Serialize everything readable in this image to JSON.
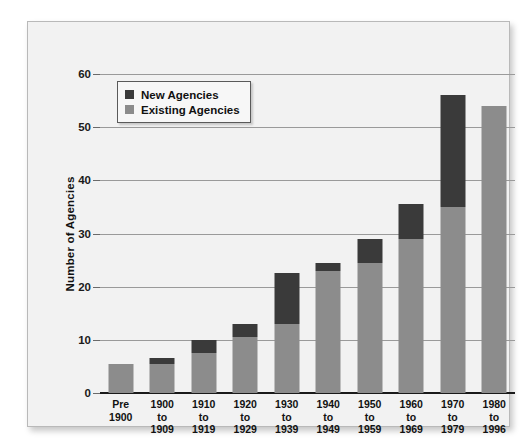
{
  "chart_data": {
    "type": "bar",
    "subtype": "stacked-bar",
    "title": "",
    "xlabel": "",
    "ylabel": "Number of Agencies",
    "ylim": [
      0,
      60
    ],
    "yticks": [
      0,
      10,
      20,
      30,
      40,
      50,
      60
    ],
    "grid": true,
    "legend_position": "top-left",
    "categories": [
      "Pre 1900",
      "1900 to 1909",
      "1910 to 1919",
      "1920 to 1929",
      "1930 to 1939",
      "1940 to 1949",
      "1950 to 1959",
      "1960 to 1969",
      "1970 to 1979",
      "1980 to 1996"
    ],
    "category_lines": [
      [
        "Pre",
        "1900"
      ],
      [
        "1900",
        "to",
        "1909"
      ],
      [
        "1910",
        "to",
        "1919"
      ],
      [
        "1920",
        "to",
        "1929"
      ],
      [
        "1930",
        "to",
        "1939"
      ],
      [
        "1940",
        "to",
        "1949"
      ],
      [
        "1950",
        "to",
        "1959"
      ],
      [
        "1960",
        "to",
        "1969"
      ],
      [
        "1970",
        "to",
        "1979"
      ],
      [
        "1980",
        "to",
        "1996"
      ]
    ],
    "series": [
      {
        "name": "Existing Agencies",
        "color": "#8c8c8c",
        "values": [
          5.5,
          5.5,
          7.5,
          10.5,
          13,
          23,
          24.5,
          29,
          35,
          54
        ]
      },
      {
        "name": "New Agencies",
        "color": "#3a3a3a",
        "values": [
          0,
          1,
          2.5,
          2.5,
          9.5,
          1.5,
          4.5,
          6.5,
          21,
          0
        ]
      }
    ],
    "totals": [
      5.5,
      6.5,
      10,
      13,
      22.5,
      24.5,
      29,
      35.5,
      56,
      54
    ]
  },
  "legend": {
    "items": [
      {
        "label": "New Agencies",
        "swatch": "new"
      },
      {
        "label": "Existing Agencies",
        "swatch": "existing"
      }
    ]
  }
}
